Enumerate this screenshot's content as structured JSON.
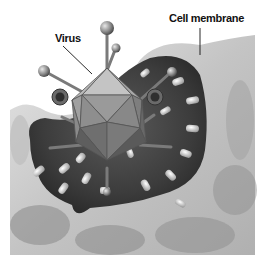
{
  "figure": {
    "style": "grayscale illustration",
    "labels": {
      "virus": "Virus",
      "cell_membrane": "Cell membrane"
    }
  },
  "colors": {
    "background": "#ffffff",
    "membrane_light": "#d9d9d9",
    "membrane_mid": "#a6a6a6",
    "pocket_dark": "#3a3a3a",
    "virus_face_light": "#b5b5b5",
    "virus_face_dark": "#6f6f6f",
    "label_text": "#111111"
  }
}
